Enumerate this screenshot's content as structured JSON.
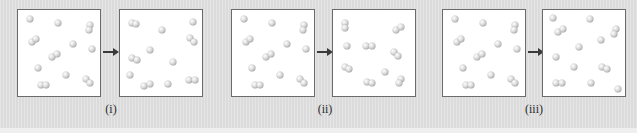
{
  "figure": {
    "colors": {
      "background": "#e2e2e2",
      "box_fill": "#ffffff",
      "box_border": "#6b6b6b",
      "arrow": "#3a3a3a",
      "atom": "#c8c8c8"
    }
  },
  "initial_state": {
    "atoms": [
      [
        12,
        9
      ],
      [
        40,
        13
      ],
      [
        72,
        15
      ],
      [
        71,
        20
      ],
      [
        14,
        32
      ],
      [
        18,
        29
      ],
      [
        55,
        34
      ],
      [
        74,
        39
      ],
      [
        34,
        47
      ],
      [
        39,
        44
      ],
      [
        20,
        58
      ],
      [
        48,
        65
      ],
      [
        68,
        69
      ],
      [
        72,
        73
      ],
      [
        23,
        75
      ],
      [
        28,
        75
      ]
    ]
  },
  "panels": [
    {
      "label": "(i)",
      "before_left": 17,
      "after_left": 119,
      "arrow_left": 103,
      "label_left": 91,
      "after_atoms": [
        [
          12,
          13
        ],
        [
          16,
          14
        ],
        [
          42,
          20
        ],
        [
          73,
          12
        ],
        [
          70,
          28
        ],
        [
          74,
          32
        ],
        [
          30,
          40
        ],
        [
          12,
          48
        ],
        [
          17,
          50
        ],
        [
          53,
          52
        ],
        [
          10,
          65
        ],
        [
          24,
          76
        ],
        [
          30,
          74
        ],
        [
          48,
          74
        ],
        [
          69,
          70
        ],
        [
          75,
          70
        ]
      ]
    },
    {
      "label": "(ii)",
      "before_left": 231,
      "after_left": 332,
      "arrow_left": 317,
      "label_left": 305,
      "after_atoms": [
        [
          12,
          13
        ],
        [
          12,
          18
        ],
        [
          63,
          20
        ],
        [
          68,
          17
        ],
        [
          14,
          36
        ],
        [
          33,
          36
        ],
        [
          39,
          36
        ],
        [
          61,
          42
        ],
        [
          65,
          46
        ],
        [
          12,
          57
        ],
        [
          16,
          59
        ],
        [
          52,
          62
        ],
        [
          34,
          72
        ],
        [
          39,
          73
        ],
        [
          68,
          69
        ],
        [
          66,
          73
        ]
      ]
    },
    {
      "label": "(iii)",
      "before_left": 442,
      "after_left": 542,
      "arrow_left": 528,
      "label_left": 514,
      "after_atoms": [
        [
          10,
          8
        ],
        [
          47,
          9
        ],
        [
          15,
          22
        ],
        [
          20,
          19
        ],
        [
          73,
          19
        ],
        [
          71,
          24
        ],
        [
          58,
          30
        ],
        [
          36,
          37
        ],
        [
          13,
          47
        ],
        [
          31,
          57
        ],
        [
          59,
          57
        ],
        [
          64,
          59
        ],
        [
          13,
          73
        ],
        [
          19,
          73
        ],
        [
          48,
          73
        ],
        [
          75,
          79
        ]
      ]
    }
  ]
}
